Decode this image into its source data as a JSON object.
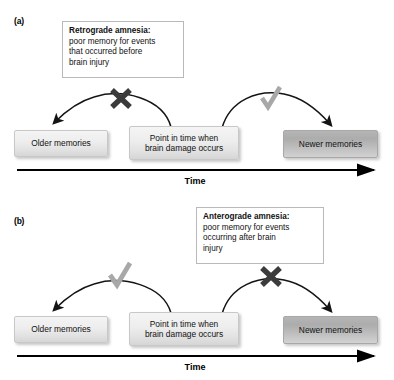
{
  "figure": {
    "type": "diagram"
  },
  "panels": [
    {
      "id": "a",
      "label": "(a)",
      "note": {
        "title": "Retrograde amnesia:",
        "body": "poor memory for events\nthat occurred before\nbrain injury"
      },
      "boxes": {
        "older": "Older memories",
        "point": "Point in time when\nbrain damage occurs",
        "newer": "Newer memories"
      },
      "marks": {
        "left": "x-mark-icon",
        "left_symbol": "✕",
        "right": "check-mark-icon",
        "right_symbol": "✓"
      },
      "axis": {
        "label": "Time"
      }
    },
    {
      "id": "b",
      "label": "(b)",
      "note": {
        "title": "Anterograde amnesia:",
        "body": "poor memory for events\noccurring after brain\ninjury"
      },
      "boxes": {
        "older": "Older memories",
        "point": "Point in time when\nbrain damage occurs",
        "newer": "Newer memories"
      },
      "marks": {
        "left": "check-mark-icon",
        "left_symbol": "✓",
        "right": "x-mark-icon",
        "right_symbol": "✕"
      },
      "axis": {
        "label": "Time"
      }
    }
  ],
  "colors": {
    "x_mark": "#3b3b3b",
    "check_mark": "#a0a0a0",
    "arc": "#141414",
    "axis": "#000000",
    "box_light_top": "#f4f4f4",
    "box_light_bottom": "#d6d6d6",
    "box_dark_top": "#b5b5b5",
    "box_dark_bottom": "#d2d2d2",
    "note_border": "#b9b9b9",
    "background": "#ffffff"
  }
}
